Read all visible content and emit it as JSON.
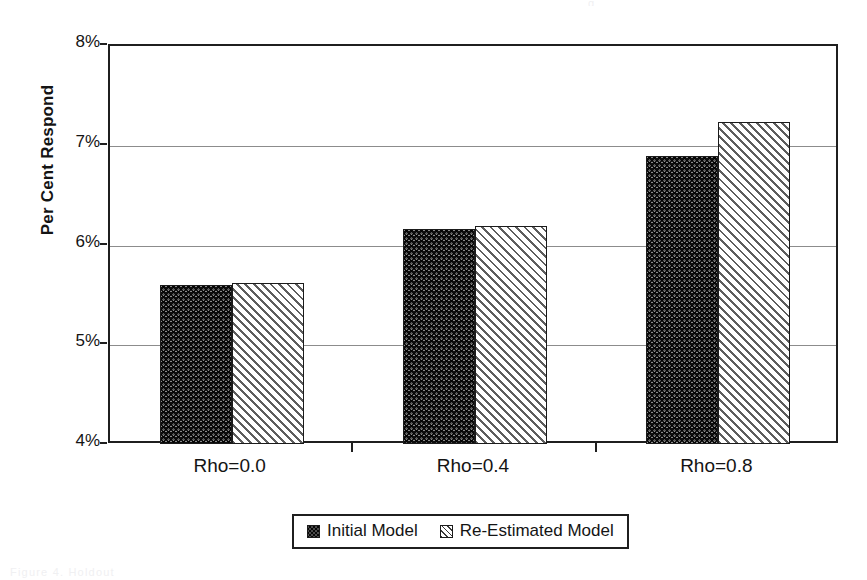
{
  "chart_data": {
    "type": "bar",
    "title": "",
    "subtitle": "",
    "xlabel": "",
    "ylabel": "Per Cent Respond",
    "categories": [
      "Rho=0.0",
      "Rho=0.4",
      "Rho=0.8"
    ],
    "series": [
      {
        "name": "Initial Model",
        "values": [
          5.6,
          6.17,
          6.9
        ]
      },
      {
        "name": "Re-Estimated Model",
        "values": [
          5.62,
          6.2,
          7.24
        ]
      }
    ],
    "ylim": [
      4,
      8
    ],
    "ytick_values": [
      8,
      7,
      6,
      5,
      4
    ],
    "ytick_labels": [
      "8%",
      "7%",
      "6%",
      "5%",
      "4%"
    ],
    "y_tick_step": 1,
    "y_unit": "%",
    "grid": true,
    "grid_axis": "y",
    "legend_position": "bottom-center",
    "legend": [
      {
        "label": "Initial Model",
        "pattern": "dark-crosshatch",
        "color": "#585858"
      },
      {
        "label": "Re-Estimated Model",
        "pattern": "light-diagonal-hatch",
        "color": "#ffffff"
      }
    ]
  },
  "axes": {
    "y_title": "Per Cent Respond",
    "y_ticks": [
      {
        "label": "8%",
        "value": 8
      },
      {
        "label": "7%",
        "value": 7
      },
      {
        "label": "6%",
        "value": 6
      },
      {
        "label": "5%",
        "value": 5
      },
      {
        "label": "4%",
        "value": 4
      }
    ],
    "x_ticks": [
      {
        "label": "Rho=0.0"
      },
      {
        "label": "Rho=0.4"
      },
      {
        "label": "Rho=0.8"
      }
    ]
  },
  "legend": {
    "entries": [
      {
        "label": "Initial Model"
      },
      {
        "label": "Re-Estimated Model"
      }
    ]
  },
  "artifacts": {
    "top_remnant": "g",
    "bottom_remnant": "Figure 4. Holdout"
  },
  "colors": {
    "axis": "#1f1f1f",
    "gridline": "#8c8c8c",
    "text": "#141414",
    "background": "#ffffff",
    "series_initial": "#585858",
    "series_reestimated": "#ffffff"
  }
}
